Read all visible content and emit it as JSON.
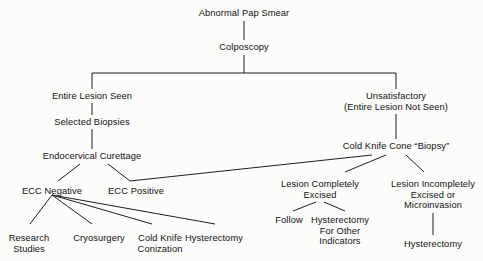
{
  "diagram": {
    "background_color": "#fcfcfa",
    "line_color": "#1d1d1d",
    "text_color": "#111111",
    "nodes": [
      {
        "id": "abnormal_pap_smear",
        "label": "Abnormal Pap Smear",
        "x": 244,
        "y": 8
      },
      {
        "id": "colposcopy",
        "label": "Colposcopy",
        "x": 244,
        "y": 42
      },
      {
        "id": "entire_lesion_seen",
        "label": "Entire Lesion Seen",
        "x": 92,
        "y": 91
      },
      {
        "id": "unsatisfactory",
        "label": "Unsatisfactory\n(Entire Lesion Not Seen)",
        "x": 396,
        "y": 91
      },
      {
        "id": "selected_biopsies",
        "label": "Selected Biopsies",
        "x": 92,
        "y": 117
      },
      {
        "id": "cold_knife_cone_biopsy",
        "label": "Cold Knife Cone “Biopsy”",
        "x": 396,
        "y": 141
      },
      {
        "id": "endocervical_curettage",
        "label": "Endocervical Curettage",
        "x": 92,
        "y": 151
      },
      {
        "id": "ecc_negative",
        "label": "ECC Negative",
        "x": 52,
        "y": 186
      },
      {
        "id": "ecc_positive",
        "label": "ECC Positive",
        "x": 136,
        "y": 186
      },
      {
        "id": "lesion_completely_excised",
        "label": "Lesion Completely\nExcised",
        "x": 320,
        "y": 179
      },
      {
        "id": "lesion_incompletely_excised",
        "label": "Lesion Incompletely\nExcised or\nMicroinvasion",
        "x": 433,
        "y": 179
      },
      {
        "id": "research_studies",
        "label": "Research\nStudies",
        "x": 29,
        "y": 233
      },
      {
        "id": "cryosurgery",
        "label": "Cryosurgery",
        "x": 99,
        "y": 233
      },
      {
        "id": "cold_knife_conization",
        "label": "Cold Knife\nConization",
        "x": 160,
        "y": 233
      },
      {
        "id": "hysterectomy_ecc",
        "label": "Hysterectomy",
        "x": 214,
        "y": 233
      },
      {
        "id": "follow",
        "label": "Follow",
        "x": 289,
        "y": 215
      },
      {
        "id": "hysterectomy_for_other_indicators",
        "label": "Hysterectomy\nFor Other\nIndicators",
        "x": 340,
        "y": 215
      },
      {
        "id": "hysterectomy_microinvasion",
        "label": "Hysterectomy",
        "x": 433,
        "y": 239
      }
    ],
    "edges": [
      {
        "from": "abnormal_pap_smear",
        "to": "colposcopy",
        "type": "vertical",
        "x1": 244,
        "y1": 21,
        "x2": 244,
        "y2": 40
      },
      {
        "from": "colposcopy",
        "to": "split_bar",
        "type": "vertical",
        "x1": 244,
        "y1": 55,
        "x2": 244,
        "y2": 73
      },
      {
        "from": "split_bar",
        "to": "split_bar",
        "type": "horizontal",
        "x1": 92,
        "y1": 73,
        "x2": 396,
        "y2": 73
      },
      {
        "from": "split_bar",
        "to": "entire_lesion_seen",
        "type": "vertical",
        "x1": 92,
        "y1": 73,
        "x2": 92,
        "y2": 89
      },
      {
        "from": "split_bar",
        "to": "unsatisfactory",
        "type": "vertical",
        "x1": 396,
        "y1": 73,
        "x2": 396,
        "y2": 89
      },
      {
        "from": "entire_lesion_seen",
        "to": "selected_biopsies",
        "type": "vertical",
        "x1": 92,
        "y1": 103,
        "x2": 92,
        "y2": 115
      },
      {
        "from": "selected_biopsies",
        "to": "endocervical_curettage",
        "type": "vertical",
        "x1": 92,
        "y1": 129,
        "x2": 92,
        "y2": 149
      },
      {
        "from": "unsatisfactory",
        "to": "cold_knife_cone_biopsy",
        "type": "vertical",
        "x1": 396,
        "y1": 114,
        "x2": 396,
        "y2": 139
      },
      {
        "from": "endocervical_curettage",
        "to": "ecc_negative",
        "type": "diagonal",
        "x1": 80,
        "y1": 164,
        "x2": 58,
        "y2": 181
      },
      {
        "from": "endocervical_curettage",
        "to": "ecc_positive",
        "type": "diagonal",
        "x1": 108,
        "y1": 164,
        "x2": 130,
        "y2": 181
      },
      {
        "from": "ecc_positive",
        "to": "cold_knife_cone_biopsy",
        "type": "diagonal",
        "x1": 130,
        "y1": 181,
        "x2": 372,
        "y2": 155
      },
      {
        "from": "ecc_negative",
        "to": "research_studies",
        "type": "diagonal",
        "x1": 52,
        "y1": 195,
        "x2": 30,
        "y2": 224
      },
      {
        "from": "ecc_negative",
        "to": "cryosurgery",
        "type": "diagonal",
        "x1": 52,
        "y1": 195,
        "x2": 92,
        "y2": 224
      },
      {
        "from": "ecc_negative",
        "to": "cold_knife_conization",
        "type": "diagonal",
        "x1": 52,
        "y1": 195,
        "x2": 152,
        "y2": 224
      },
      {
        "from": "ecc_negative",
        "to": "hysterectomy_ecc",
        "type": "diagonal",
        "x1": 52,
        "y1": 195,
        "x2": 215,
        "y2": 224
      },
      {
        "from": "cold_knife_cone_biopsy",
        "to": "lesion_completely_excised",
        "type": "diagonal",
        "x1": 386,
        "y1": 155,
        "x2": 345,
        "y2": 172
      },
      {
        "from": "cold_knife_cone_biopsy",
        "to": "lesion_incompletely_excised",
        "type": "diagonal",
        "x1": 406,
        "y1": 155,
        "x2": 424,
        "y2": 172
      },
      {
        "from": "lesion_completely_excised",
        "to": "follow",
        "type": "diagonal",
        "x1": 316,
        "y1": 202,
        "x2": 293,
        "y2": 211
      },
      {
        "from": "lesion_completely_excised",
        "to": "hysterectomy_for_other_indicators",
        "type": "diagonal",
        "x1": 324,
        "y1": 202,
        "x2": 345,
        "y2": 211
      },
      {
        "from": "lesion_incompletely_excised",
        "to": "hysterectomy_microinvasion",
        "type": "vertical",
        "x1": 433,
        "y1": 213,
        "x2": 433,
        "y2": 235
      }
    ]
  }
}
